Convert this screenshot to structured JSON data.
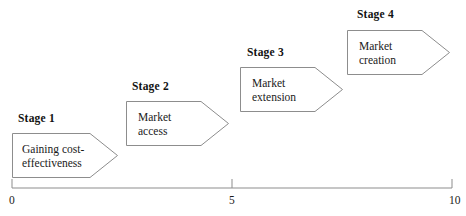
{
  "diagram": {
    "type": "staged-chevron-timeline",
    "stages": [
      {
        "label": "Stage 1",
        "text": "Gaining cost-\neffectiveness",
        "label_x": 18,
        "label_y": 112,
        "box_x": 12,
        "box_y": 133,
        "box_w": 106,
        "box_h": 45,
        "notch": 28,
        "text_x": 10,
        "text_y": 9
      },
      {
        "label": "Stage 2",
        "text": "Market\naccess",
        "label_x": 132,
        "label_y": 80,
        "box_x": 126,
        "box_y": 101,
        "box_w": 103,
        "box_h": 45,
        "notch": 28,
        "text_x": 12,
        "text_y": 9
      },
      {
        "label": "Stage 3",
        "text": "Market\nextension",
        "label_x": 247,
        "label_y": 46,
        "box_x": 240,
        "box_y": 67,
        "box_w": 103,
        "box_h": 45,
        "notch": 28,
        "text_x": 12,
        "text_y": 9
      },
      {
        "label": "Stage 4",
        "text": "Market\ncreation",
        "label_x": 357,
        "label_y": 8,
        "box_x": 347,
        "box_y": 30,
        "box_w": 103,
        "box_h": 45,
        "notch": 28,
        "text_x": 12,
        "text_y": 9
      }
    ]
  },
  "chart_data": {
    "type": "line",
    "title": "",
    "xlabel": "",
    "ylabel": "",
    "xlim": [
      0,
      10
    ],
    "grid": false,
    "legend": "none",
    "axis": {
      "orientation": "horizontal",
      "start_px": 12,
      "end_px": 452,
      "baseline_px": 188,
      "tick_len_px": 9,
      "ticks": [
        {
          "value": 0,
          "label": "0",
          "x_px": 12
        },
        {
          "value": 5,
          "label": "5",
          "x_px": 232
        },
        {
          "value": 10,
          "label": "10",
          "x_px": 452
        }
      ]
    },
    "categories": [
      "Stage 1",
      "Stage 2",
      "Stage 3",
      "Stage 4"
    ],
    "annotations": [
      {
        "text": "Gaining cost-effectiveness",
        "stage": "Stage 1",
        "x_range": [
          0,
          2.4
        ]
      },
      {
        "text": "Market access",
        "stage": "Stage 2",
        "x_range": [
          2.6,
          4.9
        ]
      },
      {
        "text": "Market extension",
        "stage": "Stage 3",
        "x_range": [
          5.2,
          7.5
        ]
      },
      {
        "text": "Market creation",
        "stage": "Stage 4",
        "x_range": [
          7.6,
          10.0
        ]
      }
    ]
  },
  "colors": {
    "stroke": "#8d8d8d",
    "text": "#1a1a1a",
    "background": "#ffffff"
  },
  "axis_labels": {
    "start": "0",
    "middle": "5",
    "end": "10"
  }
}
